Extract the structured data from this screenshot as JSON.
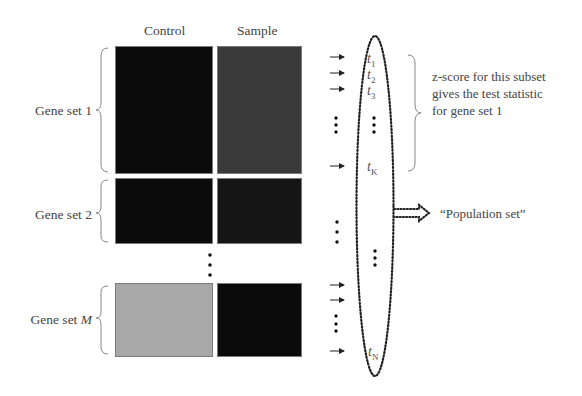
{
  "columns": {
    "control": "Control",
    "sample": "Sample"
  },
  "gene_sets": [
    {
      "label": "Gene set 1",
      "control_shade": "#0b0b0b",
      "sample_shade": "#3a3a3a"
    },
    {
      "label": "Gene set 2",
      "control_shade": "#0b0b0b",
      "sample_shade": "#151515"
    },
    {
      "label_prefix": "Gene set ",
      "label_var": "M",
      "control_shade": "#a9a9a9",
      "sample_shade": "#0b0b0b"
    }
  ],
  "statistics": [
    {
      "symbol": "t",
      "subscript": "1"
    },
    {
      "symbol": "t",
      "subscript": "2"
    },
    {
      "symbol": "t",
      "subscript": "3"
    },
    {
      "symbol": "t",
      "subscript": "K"
    },
    {
      "symbol": "t",
      "subscript": "N"
    }
  ],
  "annotations": {
    "subset_note_line1": "z-score for this subset",
    "subset_note_line2": "gives the test statistic",
    "subset_note_line3": "for gene set 1",
    "population_label": "“Population set”"
  }
}
